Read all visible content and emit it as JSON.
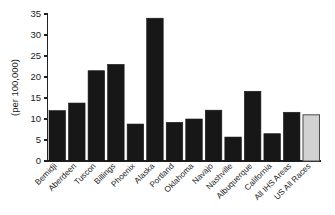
{
  "chart_data": {
    "type": "bar",
    "title": "",
    "subtitle": "",
    "xlabel": "",
    "ylabel": "(per 100,000)",
    "ylim": [
      0,
      35
    ],
    "ytick_step": 5,
    "yticks": [
      "0",
      "5",
      "10",
      "15",
      "20",
      "25",
      "30",
      "35"
    ],
    "grid": false,
    "legend": "none",
    "categories": [
      "Bemidji",
      "Aberdeen",
      "Tuscon",
      "Billings",
      "Phoenix",
      "Alaska",
      "Portland",
      "Oklahoma",
      "Navajo",
      "Nashville",
      "Albuquerque",
      "California",
      "All IHS Areas",
      "US All Races"
    ],
    "values": [
      12.0,
      13.8,
      21.5,
      23.0,
      8.8,
      34.0,
      9.2,
      10.0,
      12.1,
      5.7,
      16.6,
      6.5,
      11.6,
      11.0
    ],
    "bar_styles": [
      "dark",
      "dark",
      "dark",
      "dark",
      "dark",
      "dark",
      "dark",
      "dark",
      "dark",
      "dark",
      "dark",
      "dark",
      "dark",
      "light"
    ],
    "colors": {
      "bar_dark": "#171717",
      "bar_light_fill": "#d2d2d2",
      "bar_light_stroke": "#4a4a4a",
      "axis": "#222222",
      "background": "#ffffff",
      "text": "#1a1a1a"
    },
    "label_rotation_deg": 45
  }
}
